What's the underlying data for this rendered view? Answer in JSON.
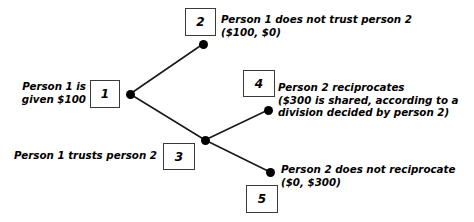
{
  "diagram": {
    "type": "game-tree",
    "background_color": "#ffffff",
    "line_color": "#1a1a1a",
    "node_color": "#000000",
    "box_border_color": "#3a3a3a",
    "text_color": "#000000"
  },
  "nodes": [
    {
      "id": "1",
      "box_label": "1",
      "x": 130,
      "y": 94,
      "box": {
        "x": 90,
        "y": 80,
        "w": 30,
        "h": 28
      }
    },
    {
      "id": "2",
      "box_label": "2",
      "x": 203,
      "y": 44,
      "box": {
        "x": 185,
        "y": 8,
        "w": 31,
        "h": 28
      }
    },
    {
      "id": "3",
      "box_label": "3",
      "x": 205,
      "y": 140,
      "box": {
        "x": 163,
        "y": 143,
        "w": 32,
        "h": 27
      }
    },
    {
      "id": "4",
      "box_label": "4",
      "x": 268,
      "y": 110,
      "box": {
        "x": 243,
        "y": 70,
        "w": 32,
        "h": 27
      }
    },
    {
      "id": "5",
      "box_label": "5",
      "x": 270,
      "y": 172,
      "box": {
        "x": 246,
        "y": 185,
        "w": 32,
        "h": 28
      }
    }
  ],
  "edges": [
    {
      "from": "1",
      "to": "2",
      "x1": 130,
      "y1": 94,
      "x2": 203,
      "y2": 44
    },
    {
      "from": "1",
      "to": "3",
      "x1": 130,
      "y1": 94,
      "x2": 205,
      "y2": 140
    },
    {
      "from": "3",
      "to": "4",
      "x1": 205,
      "y1": 140,
      "x2": 268,
      "y2": 110
    },
    {
      "from": "3",
      "to": "5",
      "x1": 205,
      "y1": 140,
      "x2": 270,
      "y2": 172
    }
  ],
  "labels": {
    "initial_endowment": "Person 1 is\ngiven $100",
    "trust_action": "Person 1 trusts person 2",
    "outcome_no_trust": "Person 1 does not trust person 2\n($100, $0)",
    "outcome_reciprocate": "Person 2 reciprocates\n($300 is shared, according to a\ndivision decided by person 2)",
    "outcome_no_reciprocate": "Person 2 does not reciprocate\n($0, $300)"
  },
  "payoffs": {
    "no_trust": {
      "person1": "$100",
      "person2": "$0"
    },
    "reciprocate": {
      "note": "$300 is shared, according to a division decided by person 2"
    },
    "no_reciprocate": {
      "person1": "$0",
      "person2": "$300"
    }
  }
}
